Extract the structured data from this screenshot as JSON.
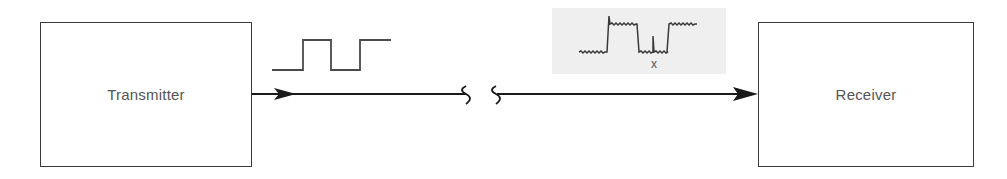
{
  "diagram": {
    "type": "block-diagram",
    "nodes": [
      {
        "id": "transmitter",
        "label": "Transmitter"
      },
      {
        "id": "receiver",
        "label": "Receiver"
      }
    ],
    "edges": [
      {
        "from": "transmitter",
        "to": "receiver",
        "style": "arrow",
        "break": "channel-break-symbol"
      }
    ],
    "signals": {
      "transmitted": {
        "name": "clean-square-pulse"
      },
      "received": {
        "name": "noisy-square-pulse",
        "marker_label": "x"
      }
    }
  }
}
